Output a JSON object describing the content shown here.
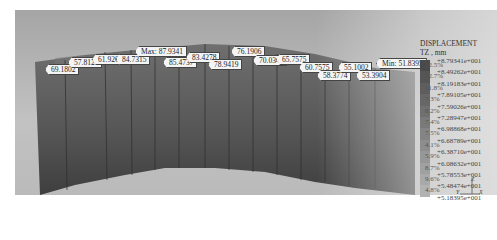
{
  "legend": {
    "title": "DISPLACEMENT",
    "subtitle": "TZ ,  mm",
    "levels": [
      {
        "value": "+8.79341e+001",
        "percent": "12.5%"
      },
      {
        "value": "+8.49262e+001",
        "percent": "12.7%"
      },
      {
        "value": "+8.19183e+001",
        "percent": "11.8%"
      },
      {
        "value": "+7.89105e+001",
        "percent": "7.3%"
      },
      {
        "value": "+7.59026e+001",
        "percent": "8.2%"
      },
      {
        "value": "+7.28947e+001",
        "percent": "7.4%"
      },
      {
        "value": "+6.98868e+001",
        "percent": "7.5%"
      },
      {
        "value": "+6.68789e+001",
        "percent": "4.1%"
      },
      {
        "value": "+6.38710e+001",
        "percent": "5.9%"
      },
      {
        "value": "+6.08632e+001",
        "percent": "8.7%"
      },
      {
        "value": "+5.78553e+001",
        "percent": "9.6%"
      },
      {
        "value": "+5.48474e+001",
        "percent": "4.8%"
      },
      {
        "value": "+5.18395e+001",
        "percent": ""
      }
    ],
    "colors": [
      "#4a4a4a",
      "#555555",
      "#5e5e5e",
      "#676767",
      "#707070",
      "#7a7a7a",
      "#848484",
      "#8d8d8d",
      "#979797",
      "#a0a0a0",
      "#a9a9a9",
      "#b2b2b2"
    ]
  },
  "probes": [
    {
      "label": "69.1802"
    },
    {
      "label": "57.8126"
    },
    {
      "label": "61.9268"
    },
    {
      "label": "84.7315"
    },
    {
      "label": "Max:  87.9341"
    },
    {
      "label": "85.4737"
    },
    {
      "label": "83.4278"
    },
    {
      "label": "78.9419"
    },
    {
      "label": "76.1906"
    },
    {
      "label": "70.0342"
    },
    {
      "label": "65.7575"
    },
    {
      "label": "60.7575"
    },
    {
      "label": "58.3774"
    },
    {
      "label": "55.1002"
    },
    {
      "label": "53.3904"
    },
    {
      "label": "Min:  51.8395"
    }
  ],
  "triad": {
    "z": "Z",
    "y": "Y",
    "x": "X"
  }
}
